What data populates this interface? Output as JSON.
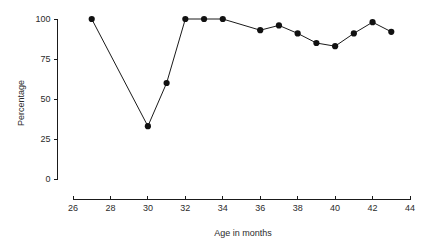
{
  "chart_data": {
    "type": "line",
    "title": "",
    "subtitle": "",
    "xlabel": "Age in months",
    "ylabel": "Percentage",
    "xlim": [
      26,
      44
    ],
    "ylim": [
      0,
      100
    ],
    "xticks": [
      26,
      28,
      30,
      32,
      34,
      36,
      38,
      40,
      42,
      44
    ],
    "xtick_labels": [
      "26",
      "28",
      "30",
      "32",
      "34",
      "36",
      "38",
      "40",
      "42",
      "44"
    ],
    "yticks": [
      0,
      25,
      50,
      75,
      100
    ],
    "ytick_labels": [
      "0",
      "25",
      "50",
      "75",
      "100"
    ],
    "grid": false,
    "legend": null,
    "legend_position": "none",
    "marker": "filled-circle",
    "line_color": "#1a1a1a",
    "marker_color": "#111111",
    "background_color": "#ffffff",
    "x": [
      27,
      30,
      31,
      32,
      33,
      34,
      36,
      37,
      38,
      39,
      40,
      41,
      42,
      43
    ],
    "y": [
      100,
      33,
      60,
      100,
      100,
      100,
      93,
      96,
      91,
      85,
      83,
      91,
      98,
      92
    ],
    "series": [
      {
        "name": "Percentage",
        "points": [
          {
            "x": 27,
            "y": 100
          },
          {
            "x": 30,
            "y": 33
          },
          {
            "x": 31,
            "y": 60
          },
          {
            "x": 32,
            "y": 100
          },
          {
            "x": 33,
            "y": 100
          },
          {
            "x": 34,
            "y": 100
          },
          {
            "x": 36,
            "y": 93
          },
          {
            "x": 37,
            "y": 96
          },
          {
            "x": 38,
            "y": 91
          },
          {
            "x": 39,
            "y": 85
          },
          {
            "x": 40,
            "y": 83
          },
          {
            "x": 41,
            "y": 91
          },
          {
            "x": 42,
            "y": 98
          },
          {
            "x": 43,
            "y": 92
          }
        ]
      }
    ]
  }
}
